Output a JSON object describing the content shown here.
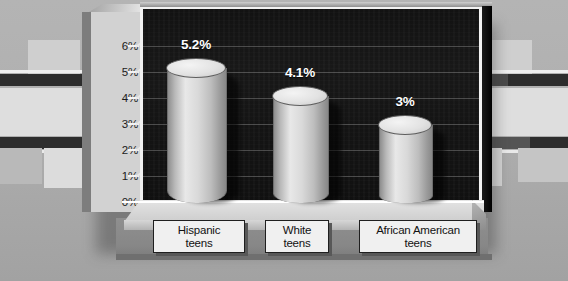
{
  "chart_data": {
    "type": "bar",
    "title": "",
    "subtitle": "",
    "xlabel": "",
    "ylabel": "",
    "categories": [
      "Hispanic teens",
      "White teens",
      "African American teens"
    ],
    "category_lines": [
      [
        "Hispanic",
        "teens"
      ],
      [
        "White",
        "teens"
      ],
      [
        "African American",
        "teens"
      ]
    ],
    "values": [
      5.2,
      4.1,
      3.0
    ],
    "data_labels": [
      "5.2%",
      "4.1%",
      "3%"
    ],
    "ylim": [
      0,
      6.5
    ],
    "ytick_values": [
      0,
      1,
      2,
      3,
      4,
      5,
      6
    ],
    "ytick_labels": [
      "0%",
      "1%",
      "2%",
      "3%",
      "4%",
      "5%",
      "6%"
    ],
    "grid": true,
    "legend": false,
    "legend_position": "none",
    "style": "3d-cylinder",
    "plot_background_color": "#141414",
    "bar_color": "#d9d9d9",
    "data_label_color": "#ffffff",
    "axis_label_color": "#1b1b1b"
  }
}
